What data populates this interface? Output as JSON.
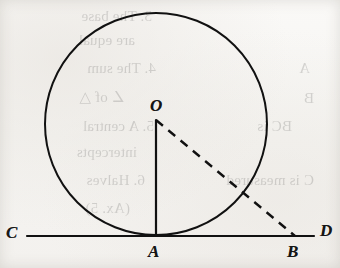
{
  "figure": {
    "caption_hidden": "Circle tangent to line CD at point A",
    "ink_color": "#111111",
    "paper_color": "#f5f4f1",
    "circle": {
      "center_x": 156,
      "center_y": 124,
      "radius": 111,
      "stroke_width": 2.0
    },
    "tangent_line": {
      "name": "CD",
      "x1": 27,
      "y1": 236,
      "x2": 314,
      "y2": 236,
      "stroke_width": 2.2
    },
    "radius_segment": {
      "name": "OA",
      "x1": 156,
      "y1": 120,
      "x2": 156,
      "y2": 236,
      "style": "solid",
      "stroke_width": 2.2
    },
    "dashed_segment": {
      "name": "OB",
      "x1": 156,
      "y1": 120,
      "x2": 295,
      "y2": 236,
      "style": "dashed",
      "dash_pattern": "9 7",
      "stroke_width": 2.4
    },
    "points": [
      {
        "id": "label-C",
        "text": "C",
        "x": 6,
        "y": 224
      },
      {
        "id": "label-D",
        "text": "D",
        "x": 320,
        "y": 222
      },
      {
        "id": "label-A",
        "text": "A",
        "x": 148,
        "y": 243
      },
      {
        "id": "label-B",
        "text": "B",
        "x": 287,
        "y": 243
      },
      {
        "id": "label-O",
        "text": "O",
        "x": 150,
        "y": 97
      }
    ]
  },
  "showthrough_text": {
    "note": "faint mirrored ink bleeding through from the reverse side of the scanned page",
    "lines": [
      {
        "text": "3. The base",
        "x": 188,
        "y": 8
      },
      {
        "text": "are equal",
        "x": 205,
        "y": 32
      },
      {
        "text": "4. The sum",
        "x": 184,
        "y": 60
      },
      {
        "text": "∠ of △",
        "x": 215,
        "y": 88
      },
      {
        "text": "5. A central",
        "x": 186,
        "y": 118
      },
      {
        "text": "intercepts",
        "x": 203,
        "y": 144
      },
      {
        "text": "6. Halves",
        "x": 195,
        "y": 172
      },
      {
        "text": "(Ax. 5)",
        "x": 210,
        "y": 200
      },
      {
        "text": "BC is",
        "x": 48,
        "y": 118
      },
      {
        "text": "C is measured",
        "x": 26,
        "y": 172
      },
      {
        "text": "A",
        "x": 30,
        "y": 60
      },
      {
        "text": "B",
        "x": 26,
        "y": 90
      }
    ]
  }
}
